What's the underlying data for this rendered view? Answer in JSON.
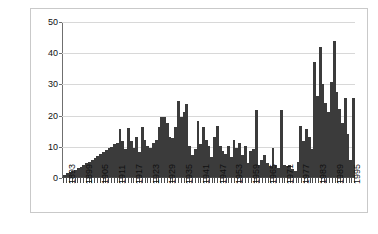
{
  "chart_data": {
    "type": "bar",
    "title": "",
    "subtitle": "",
    "xlabel": "",
    "ylabel": "Catch in millions of fish",
    "ylim": [
      0,
      50
    ],
    "yticks": [
      0,
      10,
      20,
      30,
      40,
      50
    ],
    "grid": true,
    "legend": null,
    "legend_position": "none",
    "xtick_step_years": 6,
    "xtick_labels": [
      "1893",
      "1899",
      "1905",
      "1911",
      "1917",
      "1923",
      "1929",
      "1935",
      "1941",
      "1947",
      "1953",
      "1959",
      "1965",
      "1971",
      "1977",
      "1983",
      "1989",
      "1995"
    ],
    "bar_color": "#3b3b3b",
    "categories": [
      1893,
      1894,
      1895,
      1896,
      1897,
      1898,
      1899,
      1900,
      1901,
      1902,
      1903,
      1904,
      1905,
      1906,
      1907,
      1908,
      1909,
      1910,
      1911,
      1912,
      1913,
      1914,
      1915,
      1916,
      1917,
      1918,
      1919,
      1920,
      1921,
      1922,
      1923,
      1924,
      1925,
      1926,
      1927,
      1928,
      1929,
      1930,
      1931,
      1932,
      1933,
      1934,
      1935,
      1936,
      1937,
      1938,
      1939,
      1940,
      1941,
      1942,
      1943,
      1944,
      1945,
      1946,
      1947,
      1948,
      1949,
      1950,
      1951,
      1952,
      1953,
      1954,
      1955,
      1956,
      1957,
      1958,
      1959,
      1960,
      1961,
      1962,
      1963,
      1964,
      1965,
      1966,
      1967,
      1968,
      1969,
      1970,
      1971,
      1972,
      1973,
      1974,
      1975,
      1976,
      1977,
      1978,
      1979,
      1980,
      1981,
      1982,
      1983,
      1984,
      1985,
      1986,
      1987,
      1988,
      1989,
      1990,
      1991,
      1992,
      1993,
      1994,
      1995,
      1996,
      1997
    ],
    "values": [
      0.8,
      1.2,
      1.6,
      2.0,
      2.4,
      2.8,
      3.2,
      3.8,
      4.4,
      5.0,
      5.6,
      6.2,
      6.8,
      7.4,
      8.0,
      8.6,
      9.2,
      9.8,
      10.5,
      11.0,
      15.5,
      11.5,
      9.0,
      15.8,
      11.5,
      9.5,
      13.0,
      8.0,
      16.0,
      12.0,
      10.0,
      9.5,
      11.0,
      12.0,
      16.0,
      19.5,
      19.5,
      17.5,
      13.0,
      12.5,
      16.0,
      24.5,
      19.5,
      21.0,
      23.5,
      10.0,
      7.0,
      9.0,
      18.0,
      10.5,
      16.0,
      12.0,
      10.0,
      6.5,
      13.0,
      16.5,
      10.0,
      8.5,
      7.5,
      10.0,
      6.5,
      12.0,
      9.5,
      11.0,
      7.0,
      10.0,
      4.5,
      8.5,
      9.0,
      21.5,
      4.0,
      5.5,
      7.0,
      4.5,
      3.5,
      9.5,
      4.0,
      3.0,
      21.5,
      4.0,
      3.5,
      4.0,
      2.5,
      2.0,
      5.0,
      16.5,
      11.5,
      15.5,
      13.0,
      9.0,
      37.0,
      26.0,
      42.0,
      30.0,
      24.0,
      21.0,
      30.5,
      44.0,
      27.5,
      22.0,
      17.5,
      25.5,
      14.0,
      5.5,
      25.5
    ]
  }
}
